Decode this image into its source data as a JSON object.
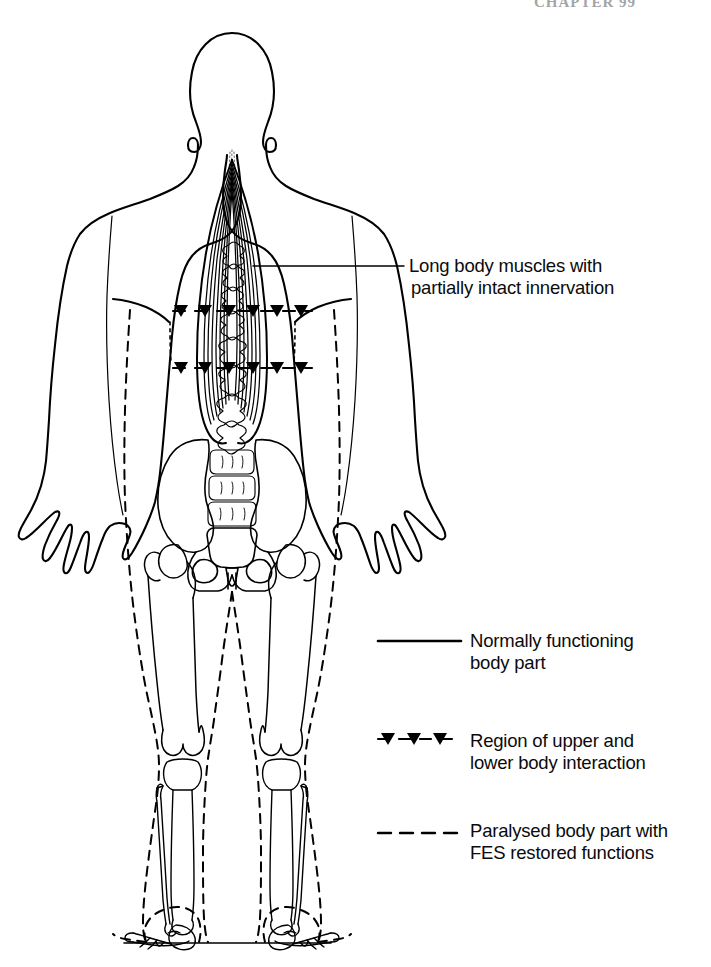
{
  "page": {
    "running_head": "CHAPTER 99",
    "background_color": "#ffffff",
    "ink_color": "#000000",
    "width": 711,
    "height": 967
  },
  "figure": {
    "view": "posterior (rear) view of standing human body",
    "ground_line": "floor line beneath the feet"
  },
  "callout": {
    "name": "long-body-muscles-callout",
    "line1": "Long body muscles with",
    "line2": "partially intact innervation",
    "leader": "horizontal leader line from the spinal muscle group to the text"
  },
  "legend": {
    "title": "",
    "items": [
      {
        "id": "normal",
        "marker": "solid-line",
        "line1": "Normally functioning",
        "line2": "body part"
      },
      {
        "id": "interaction",
        "marker": "dashed-line-with-triangles",
        "line1": "Region of upper and",
        "line2": "lower body interaction"
      },
      {
        "id": "paralysed",
        "marker": "dashed-line",
        "line1": "Paralysed body part with",
        "line2": "FES restored functions"
      }
    ]
  }
}
